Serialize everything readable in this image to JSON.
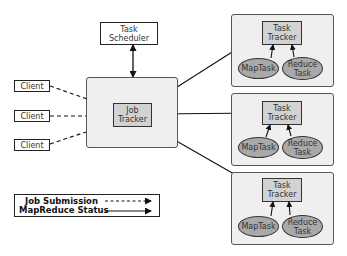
{
  "diagram": {
    "task_scheduler": {
      "label_line1": "Task",
      "label_line2": "Scheduler"
    },
    "job_tracker": {
      "label_line1": "Job",
      "label_line2": "Tracker"
    },
    "clients": [
      {
        "label": "Client"
      },
      {
        "label": "Client"
      },
      {
        "label": "Client"
      }
    ],
    "task_tracker_nodes": [
      {
        "tracker_line1": "Task",
        "tracker_line2": "Tracker",
        "map_label": "MapTask",
        "reduce_line1": "Reduce",
        "reduce_line2": "Task"
      },
      {
        "tracker_line1": "Task",
        "tracker_line2": "Tracker",
        "map_label": "MapTask",
        "reduce_line1": "Reduce",
        "reduce_line2": "Task"
      },
      {
        "tracker_line1": "Task",
        "tracker_line2": "Tracker",
        "map_label": "MapTask",
        "reduce_line1": "Reduce",
        "reduce_line2": "Task"
      }
    ],
    "legend": {
      "items": [
        {
          "label": "Job Submission",
          "line_style": "dashed"
        },
        {
          "label": "MapReduce Status",
          "line_style": "solid"
        }
      ]
    },
    "colors": {
      "panel_fill": "#efefef",
      "tracker_fill": "#d2d2d2",
      "task_fill": "#a9a9a9",
      "stroke": "#222222"
    }
  }
}
